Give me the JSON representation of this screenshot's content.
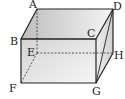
{
  "diagram": {
    "type": "cuboid",
    "vertices": {
      "A": {
        "label": "A",
        "x": 37,
        "y": 9
      },
      "B": {
        "label": "B",
        "x": 21,
        "y": 39
      },
      "C": {
        "label": "C",
        "x": 96,
        "y": 39
      },
      "D": {
        "label": "D",
        "x": 113,
        "y": 9
      },
      "E": {
        "label": "E",
        "x": 37,
        "y": 53
      },
      "F": {
        "label": "F",
        "x": 21,
        "y": 83
      },
      "G": {
        "label": "G",
        "x": 96,
        "y": 83
      },
      "H": {
        "label": "H",
        "x": 113,
        "y": 53
      }
    },
    "edges_solid": [
      "AB",
      "AD",
      "BC",
      "CD",
      "BF",
      "CG",
      "FG",
      "DH",
      "GH",
      "DG"
    ],
    "edges_hidden": [
      "AE",
      "EF",
      "EH"
    ],
    "colors": {
      "line": "#222222",
      "face_light": "#f2f2f2",
      "face_dark": "#c8c8c8"
    }
  }
}
